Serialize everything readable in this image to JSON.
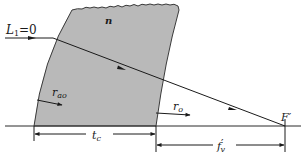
{
  "diagram": {
    "type": "optics-ray-diagram",
    "colors": {
      "lens_fill": "#b9b9b9",
      "lens_edge": "#3a3a3a",
      "line": "#2a2a2a",
      "background": "#ffffff"
    },
    "labels": {
      "incident_ray": "L",
      "incident_ray_sub": "1",
      "incident_ray_value": "=0",
      "refractive_index": "n",
      "front_radius": "r",
      "front_radius_sub": "ao",
      "back_radius": "r",
      "back_radius_sub": "o",
      "focal_point": "F",
      "focal_point_prime": "′",
      "thickness": "t",
      "thickness_sub": "c",
      "back_focal_length": "f",
      "back_focal_length_prime": "′",
      "back_focal_length_sub": "v"
    }
  }
}
